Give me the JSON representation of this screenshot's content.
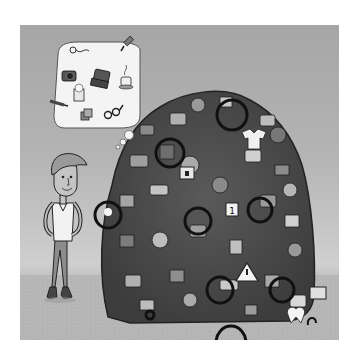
{
  "top_text_fragments": [
    "•",
    "'",
    "'"
  ],
  "illustration": {
    "subject": "man-daydreaming-beside-pile-of-stuff",
    "colors": {
      "sky_top": "#a6a6a6",
      "sky_horizon": "#cfcfcf",
      "grass": "#b6b6b6",
      "outline": "#222222",
      "bubble": "#f4f4f4",
      "pile_dark": "#3a3a3a",
      "pile_mid": "#6a6a6a",
      "pile_light": "#9a9a9a"
    },
    "thought_bubble": {
      "items": [
        {
          "name": "earbuds",
          "icon": "earbuds-icon"
        },
        {
          "name": "usb-plug",
          "icon": "usb-plug-icon"
        },
        {
          "name": "camera",
          "icon": "camera-icon"
        },
        {
          "name": "laptop",
          "icon": "laptop-icon"
        },
        {
          "name": "coffee-cup",
          "icon": "coffee-cup-icon"
        },
        {
          "name": "popcorn",
          "icon": "popcorn-icon"
        },
        {
          "name": "pencil",
          "icon": "pencil-icon"
        },
        {
          "name": "dice",
          "icon": "dice-icon"
        },
        {
          "name": "eyeglasses",
          "icon": "eyeglasses-icon"
        }
      ]
    },
    "pile": {
      "highlighted_items": [
        {
          "name": "bicycle-wheel",
          "icon": "wheel-icon"
        },
        {
          "name": "calendar",
          "icon": "calendar-icon"
        },
        {
          "name": "warning-sign",
          "icon": "warning-icon"
        },
        {
          "name": "padlock",
          "icon": "lock-icon"
        },
        {
          "name": "flower",
          "icon": "flower-icon"
        },
        {
          "name": "television",
          "icon": "tv-icon"
        },
        {
          "name": "shirt",
          "icon": "shirt-icon"
        },
        {
          "name": "mug",
          "icon": "mug-icon"
        },
        {
          "name": "headphones",
          "icon": "headphones-icon"
        },
        {
          "name": "tooth",
          "icon": "tooth-icon"
        }
      ],
      "calendar_label": "1"
    },
    "character": {
      "pose": "hands-on-hips",
      "shirt": "white v-neck",
      "pants": "gray jeans",
      "shoes": "dark boots"
    }
  }
}
